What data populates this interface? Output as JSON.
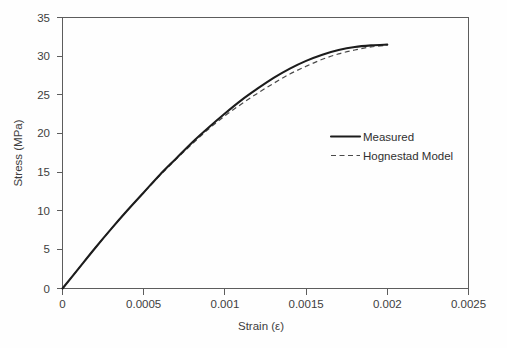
{
  "chart_data": {
    "type": "line",
    "title": "",
    "xlabel": "Strain (ε)",
    "ylabel": "Stress (MPa)",
    "xlim": [
      0,
      0.0025
    ],
    "ylim": [
      0,
      35
    ],
    "xticks": [
      "0",
      "0.0005",
      "0.001",
      "0.0015",
      "0.002",
      "0.0025"
    ],
    "xtick_values": [
      0,
      0.0005,
      0.001,
      0.0015,
      0.002,
      0.0025
    ],
    "yticks": [
      "0",
      "5",
      "10",
      "15",
      "20",
      "25",
      "30",
      "35"
    ],
    "ytick_values": [
      0,
      5,
      10,
      15,
      20,
      25,
      30,
      35
    ],
    "grid": false,
    "legend_position": "center-right",
    "series": [
      {
        "name": "Measured",
        "style": "solid",
        "color": "#1c1c1c",
        "x": [
          0,
          0.0001,
          0.0002,
          0.0003,
          0.0004,
          0.0005,
          0.0006,
          0.0007,
          0.0008,
          0.0009,
          0.001,
          0.0011,
          0.0012,
          0.0013,
          0.0014,
          0.0015,
          0.0016,
          0.0017,
          0.0018,
          0.0019,
          0.002
        ],
        "values": [
          0,
          2.6,
          5.2,
          7.7,
          10.1,
          12.4,
          14.7,
          16.8,
          18.9,
          20.8,
          22.6,
          24.3,
          25.8,
          27.2,
          28.4,
          29.4,
          30.2,
          30.8,
          31.2,
          31.4,
          31.5
        ]
      },
      {
        "name": "Hognestad Model",
        "style": "dashed",
        "color": "#4a4a4a",
        "x": [
          0,
          0.0001,
          0.0002,
          0.0003,
          0.0004,
          0.0005,
          0.0006,
          0.0007,
          0.0008,
          0.0009,
          0.001,
          0.0011,
          0.0012,
          0.0013,
          0.0014,
          0.0015,
          0.0016,
          0.0017,
          0.0018,
          0.0019,
          0.002
        ],
        "values": [
          0,
          2.6,
          5.2,
          7.7,
          10.1,
          12.4,
          14.6,
          16.7,
          18.7,
          20.6,
          22.3,
          23.8,
          25.2,
          26.5,
          27.7,
          28.7,
          29.6,
          30.3,
          30.8,
          31.2,
          31.4
        ]
      }
    ]
  },
  "legend": {
    "items": [
      {
        "label": "Measured",
        "style": "solid"
      },
      {
        "label": "Hognestad Model",
        "style": "dashed"
      }
    ]
  }
}
